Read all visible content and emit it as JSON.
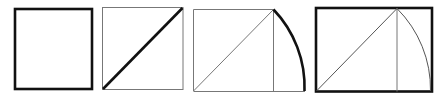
{
  "diagram": {
    "colors": {
      "stroke": "#111111",
      "thin": "#777777",
      "background": "#ffffff"
    },
    "steps": [
      {
        "id": 1,
        "description": "Square",
        "x": 14,
        "y": 8,
        "size": 78
      },
      {
        "id": 2,
        "description": "Square with diagonal",
        "x": 102,
        "y": 7,
        "size": 81
      },
      {
        "id": 3,
        "description": "Square with diagonal extended by arc",
        "x": 193,
        "y": 9,
        "size": 80,
        "arc_end_x": 305
      },
      {
        "id": 4,
        "description": "Resulting golden rectangle",
        "x": 315,
        "y": 7,
        "square_right": 397,
        "right": 432,
        "bottom": 92
      }
    ]
  }
}
